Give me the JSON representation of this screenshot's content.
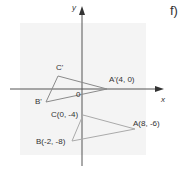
{
  "part_label": "f)",
  "axes": {
    "x_label": "x",
    "y_label": "y",
    "origin_label": "0"
  },
  "points": {
    "A": {
      "label": "A(8, -6)",
      "x": 8,
      "y": -6
    },
    "B": {
      "label": "B(-2, -8)",
      "x": -2,
      "y": -8
    },
    "C": {
      "label": "C(0, -4)",
      "x": 0,
      "y": -4
    },
    "A_prime": {
      "label": "A'(4, 0)",
      "x": 4,
      "y": 0
    },
    "B_prime": {
      "label": "B'"
    },
    "C_prime": {
      "label": "C'"
    }
  },
  "colors": {
    "panel": "#f4f4f4",
    "axis": "#555555",
    "triangle": "#8a8a8a",
    "text": "#333333"
  }
}
